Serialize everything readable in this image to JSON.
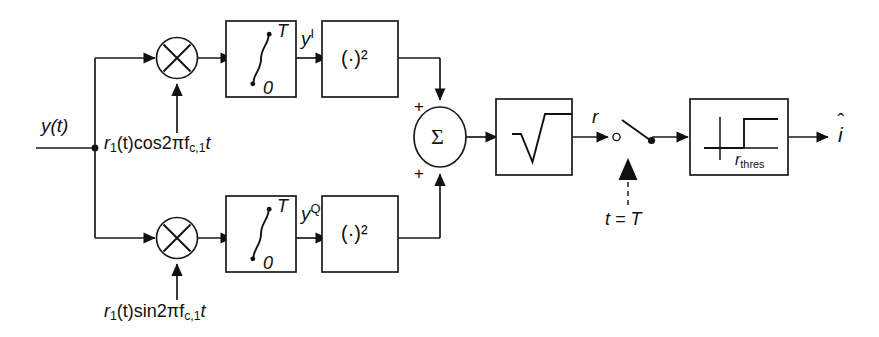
{
  "diagram": {
    "type": "signal-flow-block-diagram",
    "stroke_color": "#111111",
    "background_color": "#ffffff"
  },
  "labels": {
    "input_signal": "y(t)",
    "top_mixer_reference_prefix": "r",
    "top_mixer_reference_sub": "1",
    "top_mixer_reference_mid": "(t)cos2πf",
    "top_mixer_reference_sub2": "c,1",
    "top_mixer_reference_suffix": "t",
    "bottom_mixer_reference_prefix": "r",
    "bottom_mixer_reference_sub": "1",
    "bottom_mixer_reference_mid": "(t)sin2πf",
    "bottom_mixer_reference_sub2": "c,1",
    "bottom_mixer_reference_suffix": "t",
    "inphase_signal": "y",
    "inphase_superscript": "I",
    "quadrature_signal": "y",
    "quadrature_superscript": "Q",
    "envelope_signal": "r",
    "sampling_instant": "t = T",
    "threshold_prefix": "r",
    "threshold_sub": "thres",
    "output_symbol": "i",
    "output_hat": "ˆ",
    "integral_upper_limit": "T",
    "integral_lower_limit": "0",
    "square_block": "(·)²",
    "summer_symbol": "Σ",
    "plus_top": "+",
    "plus_bottom": "+",
    "sqrt_block": "√"
  },
  "blocks": [
    {
      "id": "top-mixer",
      "name": "multiplier-top",
      "shape": "circle",
      "glyph": "×"
    },
    {
      "id": "bottom-mixer",
      "name": "multiplier-bottom",
      "shape": "circle",
      "glyph": "×"
    },
    {
      "id": "top-integrator",
      "name": "integrator-top",
      "shape": "rect",
      "glyph": "integral-0-to-T"
    },
    {
      "id": "bottom-integrator",
      "name": "integrator-bottom",
      "shape": "rect",
      "glyph": "integral-0-to-T"
    },
    {
      "id": "top-square",
      "name": "squarer-top",
      "shape": "rect",
      "glyph": "(·)²"
    },
    {
      "id": "bottom-square",
      "name": "squarer-bottom",
      "shape": "rect",
      "glyph": "(·)²"
    },
    {
      "id": "summer",
      "name": "summing-junction",
      "shape": "circle",
      "glyph": "Σ"
    },
    {
      "id": "sqrt",
      "name": "square-root-block",
      "shape": "rect",
      "glyph": "√"
    },
    {
      "id": "sampler",
      "name": "sampling-switch",
      "shape": "switch",
      "glyph": "switch"
    },
    {
      "id": "threshold",
      "name": "threshold-detector",
      "shape": "rect",
      "glyph": "step-function"
    }
  ],
  "signal_path": [
    "y(t) input splits into in-phase and quadrature branches",
    "each branch multiplied by local carrier reference",
    "integrated over 0 to T",
    "squared",
    "summed with + and + signs",
    "square root taken to form envelope r",
    "sampled at t = T",
    "compared against r_thres to produce decision i-hat"
  ]
}
